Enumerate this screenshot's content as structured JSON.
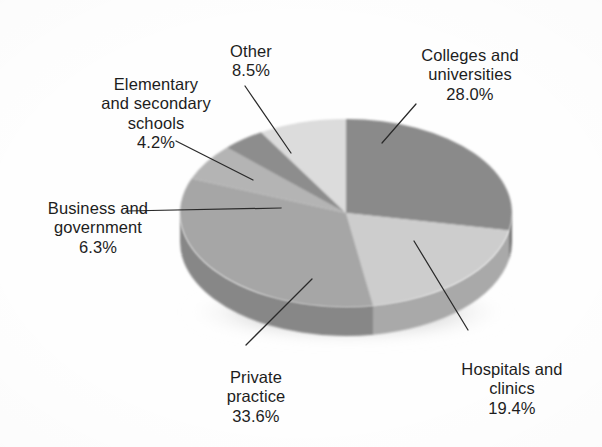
{
  "chart_data": {
    "type": "pie",
    "title": "",
    "subtitle": "",
    "xlabel": "",
    "ylabel": "",
    "legend_position": "none",
    "grid": false,
    "units": "percent",
    "three_d": true,
    "categories": [
      "Colleges and universities",
      "Hospitals and clinics",
      "Private practice",
      "Business and government",
      "Elementary and secondary schools",
      "Other"
    ],
    "values": [
      28.0,
      19.4,
      33.6,
      6.3,
      4.2,
      8.5
    ],
    "slices": [
      {
        "label": "Colleges and universities",
        "label_lines": "Colleges and\nuniversities",
        "value": 28.0,
        "value_text": "28.0%",
        "color": "#8a8a8a",
        "side_color": "#6f6f6f",
        "start_angle": 0.0,
        "end_angle": 100.8
      },
      {
        "label": "Hospitals and clinics",
        "label_lines": "Hospitals and\nclinics",
        "value": 19.4,
        "value_text": "19.4%",
        "color": "#cdcdcd",
        "side_color": "#a9a9a9",
        "start_angle": 100.8,
        "end_angle": 170.6
      },
      {
        "label": "Private practice",
        "label_lines": "Private\npractice",
        "value": 33.6,
        "value_text": "33.6%",
        "color": "#a6a6a6",
        "side_color": "#878787",
        "start_angle": 170.6,
        "end_angle": 291.5
      },
      {
        "label": "Business and government",
        "label_lines": "Business and\ngovernment",
        "value": 6.3,
        "value_text": "6.3%",
        "color": "#b4b4b4",
        "side_color": "#919191",
        "start_angle": 291.5,
        "end_angle": 314.2
      },
      {
        "label": "Elementary and secondary schools",
        "label_lines": "Elementary\nand secondary\nschools",
        "value": 4.2,
        "value_text": "4.2%",
        "color": "#8d8d8d",
        "side_color": "#747474",
        "start_angle": 314.2,
        "end_angle": 329.3
      },
      {
        "label": "Other",
        "label_lines": "Other",
        "value": 8.5,
        "value_text": "8.5%",
        "color": "#dcdcdc",
        "side_color": "#b6b6b6",
        "start_angle": 329.3,
        "end_angle": 360.0
      }
    ],
    "total": 100.0
  },
  "labels": {
    "colleges": {
      "name": "Colleges and\nuniversities",
      "pct": "28.0%"
    },
    "hospitals": {
      "name": "Hospitals and\nclinics",
      "pct": "19.4%"
    },
    "private": {
      "name": "Private\npractice",
      "pct": "33.6%"
    },
    "business": {
      "name": "Business and\ngovernment",
      "pct": "6.3%"
    },
    "elementary": {
      "name": "Elementary\nand secondary\nschools",
      "pct": "4.2%"
    },
    "other": {
      "name": "Other",
      "pct": "8.5%"
    }
  },
  "style": {
    "background": "#ffffff",
    "text_color": "#1d1d1d",
    "leader_color": "#2a2a2a"
  }
}
